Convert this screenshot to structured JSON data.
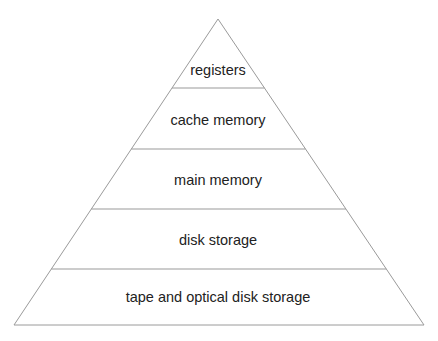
{
  "diagram": {
    "type": "pyramid",
    "colors": {
      "line": "#9a9a9a",
      "text": "#222222",
      "background": "#ffffff"
    },
    "levels": [
      {
        "label": "registers"
      },
      {
        "label": "cache memory"
      },
      {
        "label": "main memory"
      },
      {
        "label": "disk storage"
      },
      {
        "label": "tape and optical disk storage"
      }
    ]
  }
}
